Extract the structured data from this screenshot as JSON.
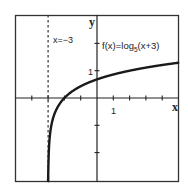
{
  "chart_data": {
    "type": "line",
    "title": "",
    "function_label": "f(x)=log",
    "function_base": "5",
    "function_arg": "(x+3)",
    "asymptote_label": "x=−3",
    "asymptote_x": -3,
    "xlabel": "x",
    "ylabel": "y",
    "x_tick_label": "1",
    "y_tick_label": "1",
    "xlim": [
      -5,
      5
    ],
    "ylim": [
      -3,
      3
    ],
    "x_ticks": [
      -4,
      -3,
      -2,
      -1,
      1,
      2,
      3,
      4
    ],
    "y_ticks": [
      -2,
      -1,
      1,
      2
    ],
    "grid": false,
    "series": [
      {
        "name": "f(x)=log5(x+3)",
        "x": [
          -2.99,
          -2.95,
          -2.9,
          -2.8,
          -2.6,
          -2.4,
          -2.0,
          -1.5,
          -1.0,
          0,
          1,
          2,
          3,
          4,
          5
        ],
        "values": [
          -2.86,
          -1.86,
          -1.43,
          -1.0,
          -0.57,
          -0.32,
          0.0,
          0.25,
          0.43,
          0.68,
          0.86,
          1.0,
          1.11,
          1.21,
          1.29
        ]
      }
    ]
  },
  "colors": {
    "axis": "#222222",
    "curve": "#1a1a1a",
    "frame": "#333333",
    "background": "#ffffff"
  }
}
